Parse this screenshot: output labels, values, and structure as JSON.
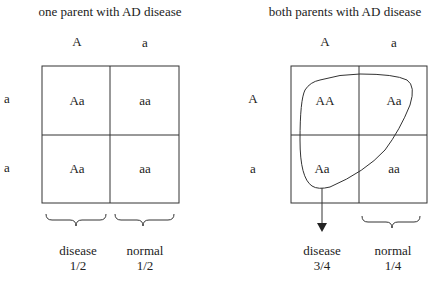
{
  "left": {
    "title": "one parent with AD disease",
    "col_headers": [
      "A",
      "a"
    ],
    "row_headers": [
      "a",
      "a"
    ],
    "cells": [
      [
        "Aa",
        "aa"
      ],
      [
        "Aa",
        "aa"
      ]
    ],
    "outcomes": [
      {
        "label": "disease",
        "ratio": "1/2"
      },
      {
        "label": "normal",
        "ratio": "1/2"
      }
    ]
  },
  "right": {
    "title": "both parents with AD disease",
    "col_headers": [
      "A",
      "a"
    ],
    "row_headers": [
      "A",
      "a"
    ],
    "cells": [
      [
        "AA",
        "Aa"
      ],
      [
        "Aa",
        "aa"
      ]
    ],
    "outcomes": [
      {
        "label": "disease",
        "ratio": "3/4"
      },
      {
        "label": "normal",
        "ratio": "1/4"
      }
    ]
  },
  "colors": {
    "line": "#333333",
    "text": "#222222"
  }
}
